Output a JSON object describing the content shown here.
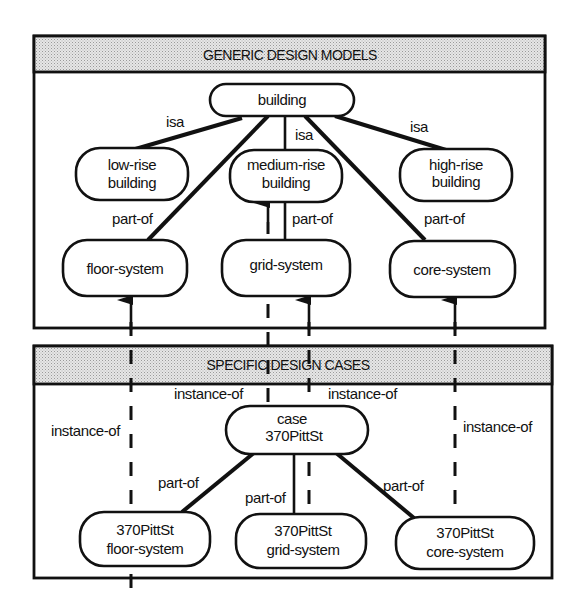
{
  "generic_panel": {
    "title": "GENERIC DESIGN  MODELS",
    "nodes": {
      "building": "building",
      "low_rise": [
        "low-rise",
        "building"
      ],
      "medium_rise": [
        "medium-rise",
        "building"
      ],
      "high_rise": [
        "high-rise",
        "building"
      ],
      "floor_system": "floor-system",
      "grid_system": "grid-system",
      "core_system": "core-system"
    },
    "edge_labels": {
      "isa_low": "isa",
      "isa_medium": "isa",
      "isa_high": "isa",
      "partof_floor": "part-of",
      "partof_grid": "part-of",
      "partof_core": "part-of"
    }
  },
  "specific_panel": {
    "title": "SPECIFIC DESIGN CASES",
    "nodes": {
      "case": [
        "case",
        "370PittSt"
      ],
      "floor": [
        "370PittSt",
        "floor-system"
      ],
      "grid": [
        "370PittSt",
        "grid-system"
      ],
      "core": [
        "370PittSt",
        "core-system"
      ]
    },
    "edge_labels": {
      "instance_left": "instance-of",
      "instance_mid_left": "instance-of",
      "instance_mid_right": "instance-of",
      "instance_right": "instance-of",
      "partof_floor": "part-of",
      "partof_grid": "part-of",
      "partof_core": "part-of"
    }
  },
  "relations": [
    {
      "from": "low-rise building",
      "to": "building",
      "type": "isa"
    },
    {
      "from": "medium-rise building",
      "to": "building",
      "type": "isa"
    },
    {
      "from": "high-rise building",
      "to": "building",
      "type": "isa"
    },
    {
      "from": "floor-system",
      "to": "building",
      "type": "part-of"
    },
    {
      "from": "grid-system",
      "to": "medium-rise building",
      "type": "part-of"
    },
    {
      "from": "core-system",
      "to": "building",
      "type": "part-of"
    },
    {
      "from": "case 370PittSt",
      "to": "medium-rise building",
      "type": "instance-of"
    },
    {
      "from": "370PittSt floor-system",
      "to": "floor-system",
      "type": "instance-of"
    },
    {
      "from": "370PittSt grid-system",
      "to": "grid-system",
      "type": "instance-of"
    },
    {
      "from": "370PittSt core-system",
      "to": "core-system",
      "type": "instance-of"
    },
    {
      "from": "370PittSt floor-system",
      "to": "case 370PittSt",
      "type": "part-of"
    },
    {
      "from": "370PittSt grid-system",
      "to": "case 370PittSt",
      "type": "part-of"
    },
    {
      "from": "370PittSt core-system",
      "to": "case 370PittSt",
      "type": "part-of"
    }
  ],
  "colors": {
    "ink": "#111111",
    "header_fill": "#d9d9d9",
    "background": "#ffffff"
  }
}
